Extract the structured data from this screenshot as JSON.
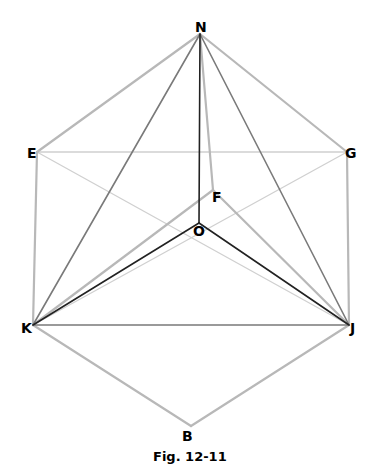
{
  "figure": {
    "caption": "Fig. 12-11",
    "points": {
      "N": {
        "label": "N",
        "x": 200,
        "y": 34
      },
      "E": {
        "label": "E",
        "x": 37,
        "y": 152
      },
      "G": {
        "label": "G",
        "x": 347,
        "y": 152
      },
      "F": {
        "label": "F",
        "x": 213,
        "y": 190
      },
      "O": {
        "label": "O",
        "x": 199,
        "y": 223
      },
      "K": {
        "label": "K",
        "x": 33,
        "y": 325
      },
      "J": {
        "label": "J",
        "x": 349,
        "y": 325
      },
      "B": {
        "label": "B",
        "x": 191,
        "y": 426
      }
    },
    "edges": [
      {
        "from": "N",
        "to": "E",
        "style": "light"
      },
      {
        "from": "N",
        "to": "G",
        "style": "light"
      },
      {
        "from": "E",
        "to": "K",
        "style": "light"
      },
      {
        "from": "G",
        "to": "J",
        "style": "light"
      },
      {
        "from": "K",
        "to": "B",
        "style": "light"
      },
      {
        "from": "J",
        "to": "B",
        "style": "light"
      },
      {
        "from": "E",
        "to": "G",
        "style": "faint"
      },
      {
        "from": "E",
        "to": "J",
        "style": "faint"
      },
      {
        "from": "G",
        "to": "K",
        "style": "faint"
      },
      {
        "from": "N",
        "to": "F",
        "style": "light"
      },
      {
        "from": "F",
        "to": "K",
        "style": "light"
      },
      {
        "from": "F",
        "to": "J",
        "style": "light"
      },
      {
        "from": "N",
        "to": "K",
        "style": "medium"
      },
      {
        "from": "N",
        "to": "J",
        "style": "medium"
      },
      {
        "from": "K",
        "to": "J",
        "style": "medium"
      },
      {
        "from": "N",
        "to": "O",
        "style": "dark"
      },
      {
        "from": "O",
        "to": "K",
        "style": "dark"
      },
      {
        "from": "O",
        "to": "J",
        "style": "dark"
      }
    ],
    "colors": {
      "faint": "#d0d0d0",
      "light": "#b8b8b8",
      "medium": "#7a7a7a",
      "dark": "#222222"
    }
  }
}
